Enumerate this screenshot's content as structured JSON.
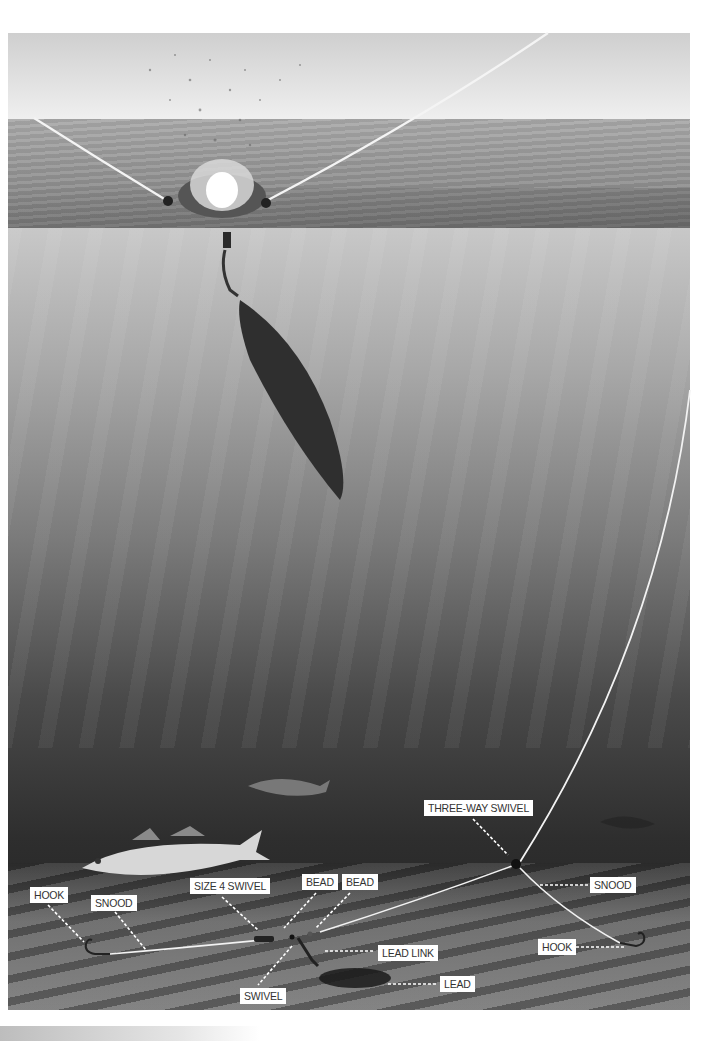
{
  "illustration": {
    "subject": "Sea fishing rig: lead weight splashing into sea and paternoster rig on seabed",
    "labels": {
      "hook_left": "HOOK",
      "snood_left": "SNOOD",
      "size4_swivel": "SIZE 4 SWIVEL",
      "bead_1": "BEAD",
      "bead_2": "BEAD",
      "lead_link": "LEAD LINK",
      "lead": "LEAD",
      "swivel": "SWIVEL",
      "three_way_swivel": "THREE-WAY SWIVEL",
      "snood_right": "SNOOD",
      "hook_right": "HOOK"
    },
    "colors": {
      "label_bg": "#ffffff",
      "label_text": "#333333",
      "line": "#f2f2f2",
      "leader_dash": "#ffffff"
    }
  }
}
